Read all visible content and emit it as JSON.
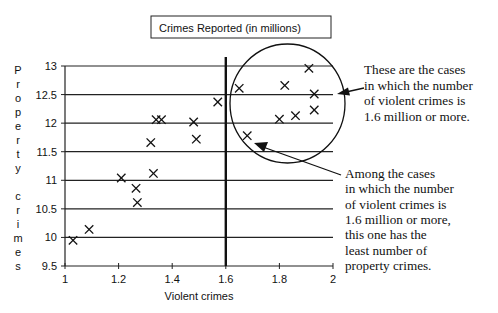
{
  "chart_data": {
    "type": "scatter",
    "title": "Crimes Reported (in millions)",
    "xlabel": "Violent crimes",
    "ylabel": "Property crimes",
    "xlim": [
      1,
      2
    ],
    "ylim": [
      9.5,
      13
    ],
    "xticks": [
      "1",
      "1.2",
      "1.4",
      "1.6",
      "1.8",
      "2"
    ],
    "xtick_values": [
      1,
      1.2,
      1.4,
      1.6,
      1.8,
      2
    ],
    "yticks": [
      "9.5",
      "10",
      "10.5",
      "11",
      "11.5",
      "12",
      "12.5",
      "13"
    ],
    "ytick_values": [
      9.5,
      10,
      10.5,
      11,
      11.5,
      12,
      12.5,
      13
    ],
    "grid": "horizontal",
    "marker": "x",
    "reference_line": {
      "axis": "x",
      "value": 1.6
    },
    "points": [
      {
        "x": 1.03,
        "y": 9.95
      },
      {
        "x": 1.09,
        "y": 10.14
      },
      {
        "x": 1.21,
        "y": 11.04
      },
      {
        "x": 1.265,
        "y": 10.86
      },
      {
        "x": 1.27,
        "y": 10.61
      },
      {
        "x": 1.32,
        "y": 11.66
      },
      {
        "x": 1.33,
        "y": 11.12
      },
      {
        "x": 1.34,
        "y": 12.06
      },
      {
        "x": 1.36,
        "y": 12.06
      },
      {
        "x": 1.48,
        "y": 12.02
      },
      {
        "x": 1.49,
        "y": 11.72
      },
      {
        "x": 1.57,
        "y": 12.37
      },
      {
        "x": 1.65,
        "y": 12.61
      },
      {
        "x": 1.68,
        "y": 11.78
      },
      {
        "x": 1.8,
        "y": 12.07
      },
      {
        "x": 1.82,
        "y": 12.66
      },
      {
        "x": 1.86,
        "y": 12.13
      },
      {
        "x": 1.91,
        "y": 12.96
      },
      {
        "x": 1.93,
        "y": 12.51
      },
      {
        "x": 1.93,
        "y": 12.23
      }
    ],
    "annotations": [
      {
        "id": "circle-note",
        "lines": [
          "These are the cases",
          "in which the number",
          "of violent crimes is",
          "1.6 million or more."
        ],
        "target": "points with violent crimes >= 1.6"
      },
      {
        "id": "min-note",
        "lines": [
          "Among the cases",
          "in which the number",
          "of violent crimes is",
          "1.6 million or more,",
          "this one has the",
          "least number of",
          "property crimes."
        ],
        "target": {
          "x": 1.68,
          "y": 11.78
        }
      }
    ]
  }
}
